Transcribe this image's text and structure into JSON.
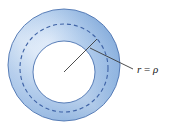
{
  "figure": {
    "name": "annulus-diagram",
    "background_color": "#ffffff",
    "width": 169,
    "height": 131
  },
  "annulus": {
    "name": "annulus-ring",
    "center_x": 64,
    "center_y": 65,
    "outer_radius": 56,
    "inner_radius": 31,
    "inner_fill": "#ffffff",
    "stroke_color": "#4a72b0",
    "stroke_width": 0.9,
    "gradient": {
      "light": "#ffffff",
      "mid": "#bcd4ee",
      "base": "#a6c4e8",
      "dark": "#7ba4d6"
    }
  },
  "dashed_circle": {
    "name": "dashed-mid-circle",
    "radius": 44,
    "stroke_color": "#3f63a6",
    "stroke_width": 1.1,
    "dash_pattern": "4 3"
  },
  "radius_line": {
    "name": "radius-line",
    "from_x": 64,
    "from_y": 72,
    "to_x": 97,
    "to_y": 39,
    "stroke_color": "#3a3a3a",
    "stroke_width": 0.9
  },
  "leader_line": {
    "name": "leader-line",
    "from_x": 90,
    "from_y": 48,
    "to_x": 133,
    "to_y": 69,
    "stroke_color": "#3a3a3a",
    "stroke_width": 0.9
  },
  "label": {
    "name": "radius-label",
    "variable": "r",
    "operator": " = ",
    "value": "ρ",
    "full_text": "r = ρ",
    "x": 136,
    "y": 73,
    "color": "#1a1a1a",
    "font_size": 11
  }
}
